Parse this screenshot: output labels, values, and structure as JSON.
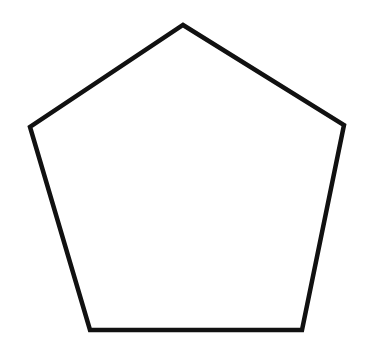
{
  "figure": {
    "shape": "pentagon",
    "stroke_color": "#111111",
    "fill_color": "#ffffff",
    "background_color": "#ffffff",
    "stroke_width": 4.5,
    "vertices": [
      {
        "x": 183,
        "y": 25
      },
      {
        "x": 344,
        "y": 125
      },
      {
        "x": 302,
        "y": 330
      },
      {
        "x": 90,
        "y": 330
      },
      {
        "x": 30,
        "y": 127
      }
    ]
  }
}
